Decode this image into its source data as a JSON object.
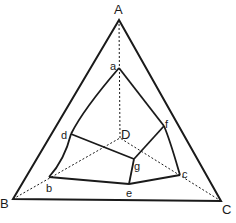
{
  "diagram": {
    "colors": {
      "stroke": "#1a1a1a",
      "background": "#ffffff"
    },
    "outer_vertices": {
      "A": {
        "label": "A",
        "x": 119,
        "y": 20
      },
      "B": {
        "label": "B",
        "x": 13,
        "y": 199
      },
      "C": {
        "label": "C",
        "x": 221,
        "y": 201
      },
      "D": {
        "label": "D",
        "x": 120,
        "y": 138
      }
    },
    "inner_points": {
      "a": {
        "label": "a",
        "x": 119,
        "y": 68
      },
      "b": {
        "label": "b",
        "x": 49,
        "y": 177
      },
      "c": {
        "label": "c",
        "x": 180,
        "y": 175
      },
      "d": {
        "label": "d",
        "x": 71,
        "y": 134
      },
      "e": {
        "label": "e",
        "x": 129,
        "y": 184
      },
      "f": {
        "label": "f",
        "x": 164,
        "y": 126
      },
      "g": {
        "label": "g",
        "x": 134,
        "y": 159
      }
    },
    "solid_edges": [
      [
        "A",
        "B"
      ],
      [
        "B",
        "C"
      ],
      [
        "C",
        "A"
      ],
      [
        "a",
        "d"
      ],
      [
        "d",
        "b"
      ],
      [
        "b",
        "e"
      ],
      [
        "e",
        "c"
      ],
      [
        "c",
        "f"
      ],
      [
        "f",
        "a"
      ],
      [
        "d",
        "g"
      ],
      [
        "g",
        "f"
      ],
      [
        "g",
        "e"
      ]
    ],
    "dashed_edges": [
      [
        "A",
        "D"
      ],
      [
        "B",
        "D"
      ],
      [
        "C",
        "D"
      ]
    ]
  }
}
